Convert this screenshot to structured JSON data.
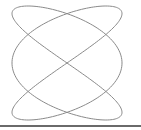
{
  "figure": {
    "type": "lissajous-curve",
    "x_frequency": 3,
    "y_frequency": 2,
    "x_phase": 1.5707963,
    "y_phase": 0,
    "center": [
      67,
      63
    ],
    "amplitude": [
      55,
      57
    ],
    "samples": 400,
    "stroke_color": "#8a8a8a",
    "stroke_width": 1
  },
  "baseline": {
    "color": "#6a6a6a"
  }
}
